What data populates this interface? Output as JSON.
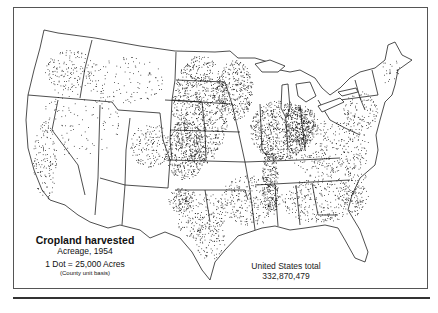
{
  "map": {
    "type": "dot-density",
    "subject": "Cropland harvested",
    "region": "Conterminous United States"
  },
  "legend": {
    "title": "Cropland harvested",
    "subtitle": "Acreage, 1954",
    "scale": "1 Dot = 25,000 Acres",
    "basis": "(County unit basis)"
  },
  "total": {
    "label": "United States total",
    "value": "332,870,479"
  },
  "colors": {
    "ink": "#111111",
    "background": "#ffffff",
    "frame": "#555555"
  }
}
